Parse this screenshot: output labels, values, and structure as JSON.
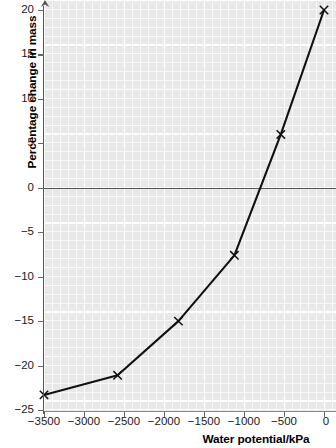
{
  "chart_data": {
    "type": "line",
    "title": "",
    "xlabel": "Water potential/kPa",
    "ylabel": "Percentage change in mass",
    "xlim": [
      -3500,
      0
    ],
    "ylim": [
      -25,
      20
    ],
    "xticks": [
      -3500,
      -3000,
      -2500,
      -2000,
      -1500,
      -1000,
      -500,
      0
    ],
    "yticks": [
      20,
      15,
      10,
      5,
      0,
      -5,
      -10,
      -15,
      -20,
      -25
    ],
    "xtick_labels": [
      "−3500",
      "−3000",
      "−2500",
      "−2000",
      "−1500",
      "−1000",
      "−500",
      "0"
    ],
    "ytick_labels": [
      "20",
      "15",
      "10",
      "5",
      "0",
      "−5",
      "−10",
      "−15",
      "−20",
      "−25"
    ],
    "grid": true,
    "grid_style": "graph-paper white lines on grey",
    "legend": "none",
    "marker": "x",
    "series": [
      {
        "name": "Percentage change in mass",
        "x": [
          -3500,
          -2580,
          -1820,
          -1120,
          -540,
          0
        ],
        "values": [
          -23.3,
          -21.1,
          -15.0,
          -7.6,
          6.0,
          20.0
        ]
      }
    ],
    "zero_reference_line": 0,
    "colors": {
      "plot_background": "#e8e8e8",
      "gridline": "#ffffff",
      "data_line": "#111111",
      "axis": "#555555",
      "text": "#1a1a1a"
    }
  },
  "axes": {
    "y_title": "Percentage change in mass",
    "x_title": "Water potential/kPa"
  }
}
